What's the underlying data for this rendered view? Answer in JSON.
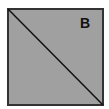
{
  "diagram": {
    "shape": "square",
    "label": "B",
    "fill_color": "#a0a0a0",
    "border_color": "#333333",
    "diagonal": "top-left to bottom-right"
  }
}
